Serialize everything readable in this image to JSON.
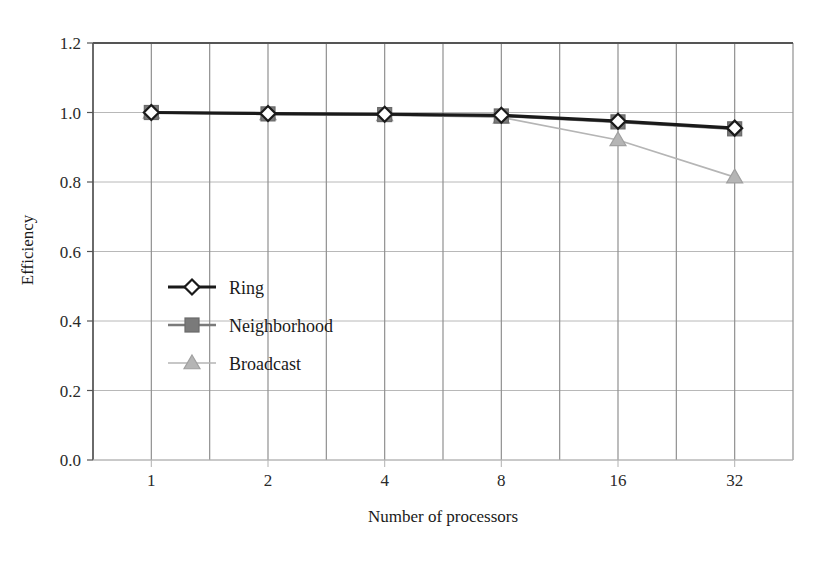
{
  "chart_data": {
    "type": "line",
    "title": "",
    "xlabel": "Number of processors",
    "ylabel": "Efficiency",
    "categories": [
      "1",
      "2",
      "4",
      "8",
      "16",
      "32"
    ],
    "x_tick_labels": [
      "1",
      "2",
      "4",
      "8",
      "16",
      "32"
    ],
    "y_tick_labels": [
      "0.0",
      "0.2",
      "0.4",
      "0.6",
      "0.8",
      "1.0",
      "1.2"
    ],
    "y_ticks": [
      0.0,
      0.2,
      0.4,
      0.6,
      0.8,
      1.0,
      1.2
    ],
    "ylim": [
      0.0,
      1.2
    ],
    "grid": true,
    "grid_style": "both-axes",
    "legend_position": "inside-left-middle",
    "series": [
      {
        "name": "Ring",
        "marker": "diamond-hollow",
        "color": "#1a1a1a",
        "values": [
          1.0,
          0.997,
          0.995,
          0.992,
          0.975,
          0.955
        ]
      },
      {
        "name": "Neighborhood",
        "marker": "square-filled",
        "color": "#7a7a7a",
        "values": [
          1.0,
          0.996,
          0.994,
          0.99,
          0.973,
          0.953
        ]
      },
      {
        "name": "Broadcast",
        "marker": "triangle-filled",
        "color": "#b5b5b5",
        "values": [
          1.0,
          0.996,
          0.993,
          0.986,
          0.921,
          0.814
        ]
      }
    ]
  },
  "axes": {
    "y_title": "Efficiency",
    "x_title": "Number of processors"
  },
  "legend": {
    "entries": [
      {
        "label": "Ring"
      },
      {
        "label": "Neighborhood"
      },
      {
        "label": "Broadcast"
      }
    ]
  },
  "colors": {
    "ring": "#1a1a1a",
    "neighborhood": "#7a7a7a",
    "broadcast": "#b5b5b5",
    "grid": "#909090",
    "grid_minor": "#b8b8b8",
    "axis": "#555555",
    "background": "#ffffff"
  }
}
